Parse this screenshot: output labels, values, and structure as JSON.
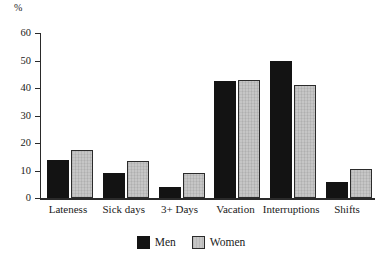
{
  "chart_data": {
    "type": "bar",
    "title": "",
    "subtitle": "",
    "xlabel": "",
    "ylabel": "%",
    "ylim": [
      0,
      60
    ],
    "yticks": [
      0,
      10,
      20,
      30,
      40,
      50,
      60
    ],
    "ytick_labels": [
      "0",
      "10",
      "20",
      "30",
      "40",
      "50",
      "60"
    ],
    "grid": false,
    "legend_position": "bottom-center",
    "categories": [
      "Lateness",
      "Sick days",
      "3+ Days",
      "Vacation",
      "Interruptions",
      "Shifts"
    ],
    "series": [
      {
        "name": "Men",
        "color": "#131313",
        "values": [
          14,
          9,
          4,
          42.5,
          50,
          6
        ]
      },
      {
        "name": "Women",
        "color": "#c6c6c6",
        "values": [
          17.5,
          13.5,
          9,
          43,
          41,
          10.5
        ]
      }
    ]
  },
  "axis": {
    "unit_label": "%"
  },
  "legend": {
    "items": [
      {
        "label": "Men"
      },
      {
        "label": "Women"
      }
    ]
  }
}
